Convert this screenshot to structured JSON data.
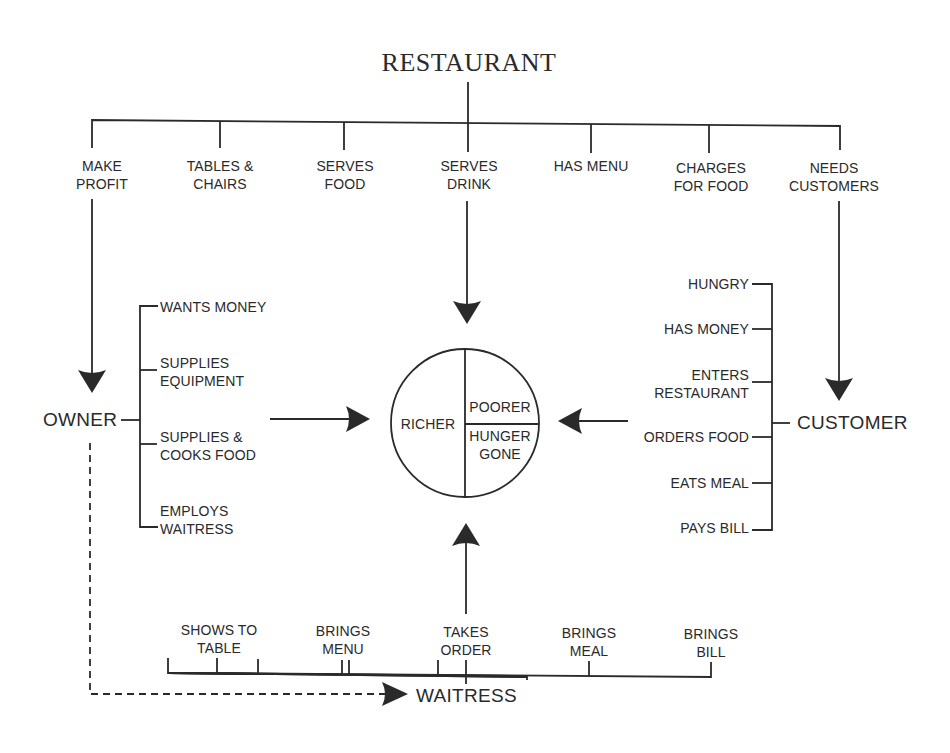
{
  "title": "RESTAURANT",
  "restaurant_attributes": [
    {
      "label": "MAKE\nPROFIT"
    },
    {
      "label": "TABLES &\nCHAIRS"
    },
    {
      "label": "SERVES\nFOOD"
    },
    {
      "label": "SERVES\nDRINK"
    },
    {
      "label": "HAS MENU"
    },
    {
      "label": "CHARGES\nFOR FOOD"
    },
    {
      "label": "NEEDS\nCUSTOMERS"
    }
  ],
  "owner": {
    "label": "OWNER",
    "attributes": [
      {
        "label": "WANTS MONEY"
      },
      {
        "label": "SUPPLIES\nEQUIPMENT"
      },
      {
        "label": "SUPPLIES &\nCOOKS FOOD"
      },
      {
        "label": "EMPLOYS\nWAITRESS"
      }
    ]
  },
  "customer": {
    "label": "CUSTOMER",
    "attributes": [
      {
        "label": "HUNGRY"
      },
      {
        "label": "HAS MONEY"
      },
      {
        "label": "ENTERS\nRESTAURANT"
      },
      {
        "label": "ORDERS FOOD"
      },
      {
        "label": "EATS MEAL"
      },
      {
        "label": "PAYS BILL"
      }
    ]
  },
  "waitress": {
    "label": "WAITRESS",
    "attributes": [
      {
        "label": "SHOWS TO\nTABLE"
      },
      {
        "label": "BRINGS\nMENU"
      },
      {
        "label": "TAKES\nORDER"
      },
      {
        "label": "BRINGS\nMEAL"
      },
      {
        "label": "BRINGS\nBILL"
      }
    ]
  },
  "outcome_circle": {
    "left": "RICHER",
    "right_top": "POORER",
    "right_bottom": "HUNGER\nGONE"
  },
  "colors": {
    "ink": "#2a2a2a",
    "background": "#ffffff"
  }
}
